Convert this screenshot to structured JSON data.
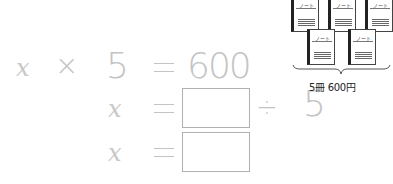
{
  "equation_1": {
    "variable": "x",
    "operator": "×",
    "multiplier": "5",
    "equals": "=",
    "result": "600"
  },
  "equation_2": {
    "variable": "x",
    "equals": "=",
    "box_value": "",
    "operator": "÷",
    "divisor": "5"
  },
  "equation_3": {
    "variable": "x",
    "equals": "=",
    "box_value": ""
  },
  "illustration": {
    "notebook_label": "ノート",
    "notebook_count": 5,
    "caption": "5冊 600円"
  }
}
